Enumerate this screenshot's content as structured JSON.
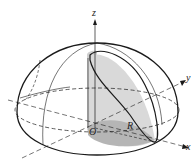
{
  "figure": {
    "labels": {
      "z": "z",
      "y": "y",
      "x": "x",
      "origin": "O",
      "radius": "R"
    },
    "colors": {
      "line": "#1a1a1a",
      "shade_light": "#d9d9d9",
      "shade_mid": "#c2c2c2",
      "shade_dark": "#a8a8a8"
    }
  }
}
